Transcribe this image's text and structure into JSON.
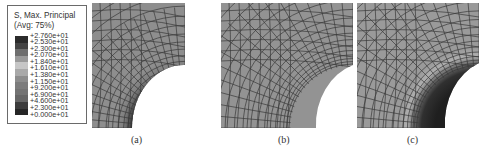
{
  "legend": {
    "title": "S, Max. Principal",
    "subtitle": "(Avg: 75%)",
    "entries": [
      {
        "label": "+2.760e+01",
        "color": "#2b2b2b"
      },
      {
        "label": "+2.530e+01",
        "color": "#444444"
      },
      {
        "label": "+2.300e+01",
        "color": "#6e6e6e"
      },
      {
        "label": "+2.070e+01",
        "color": "#9a9a9a"
      },
      {
        "label": "+1.840e+01",
        "color": "#c6c6c6"
      },
      {
        "label": "+1.610e+01",
        "color": "#a9a9a9"
      },
      {
        "label": "+1.380e+01",
        "color": "#8d8d8d"
      },
      {
        "label": "+1.150e+01",
        "color": "#7c7c7c"
      },
      {
        "label": "+9.200e+01",
        "color": "#737373"
      },
      {
        "label": "+6.900e+01",
        "color": "#666666"
      },
      {
        "label": "+4.600e+01",
        "color": "#3c3c3c"
      },
      {
        "label": "+2.300e+01",
        "color": "#262626"
      },
      {
        "label": "+0.000e+01",
        "color": "#1c1c1c"
      }
    ]
  },
  "panels": [
    {
      "caption": "(a)",
      "base_color": "#8e8e8e",
      "hotspot": "thin dark band along hole edge"
    },
    {
      "caption": "(b)",
      "base_color": "#939393",
      "hotspot": "none"
    },
    {
      "caption": "(c)",
      "base_color": "#9a9a9a",
      "hotspot": "wide dark region around hole"
    }
  ]
}
